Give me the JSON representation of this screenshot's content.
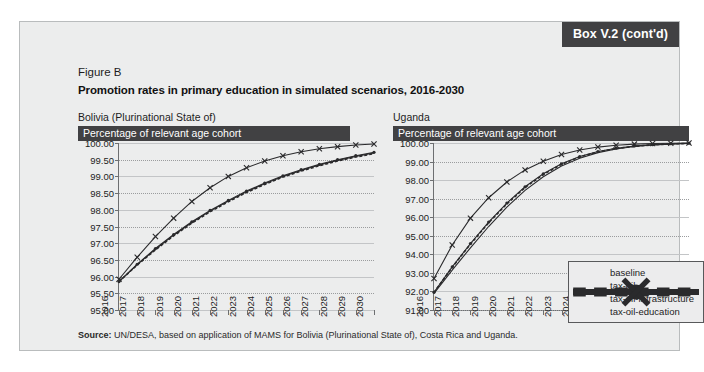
{
  "box_tag": "Box V.2 (cont'd)",
  "figure_label": "Figure B",
  "figure_title": "Promotion rates in primary education in simulated scenarios, 2016-2030",
  "source_prefix": "Source:",
  "source_text": " UN/DESA, based on application of MAMS for Bolivia (Plurinational State of), Costa Rica and Uganda.",
  "colors": {
    "box_background": "#eceded",
    "header_bar": "#414143",
    "series": "#2a2a2c",
    "grid": "#9a9c9e",
    "axis": "#6d6f71"
  },
  "legend": {
    "position": "inside-right-chart-bottom-right",
    "items": [
      {
        "label": "baseline",
        "style": "dashed",
        "marker": "none"
      },
      {
        "label": "tax-oil",
        "style": "solid",
        "marker": "none"
      },
      {
        "label": "tax-oil-infrastructure",
        "style": "solid",
        "marker": "dot"
      },
      {
        "label": "tax-oil-education",
        "style": "solid",
        "marker": "x"
      }
    ]
  },
  "chart_data": [
    {
      "type": "line",
      "panel": "left",
      "title": "Bolivia (Plurinational State of)",
      "ylabel": "Percentage of relevant age cohort",
      "xlabel": "",
      "grid": true,
      "ylim": [
        95.0,
        100.0
      ],
      "yticks": [
        "100.00",
        "99.50",
        "99.00",
        "98.50",
        "98.00",
        "97.50",
        "97.00",
        "96.50",
        "96.00",
        "95.50",
        "95.00"
      ],
      "ytick_values": [
        100.0,
        99.5,
        99.0,
        98.5,
        98.0,
        97.5,
        97.0,
        96.5,
        96.0,
        95.5,
        95.0
      ],
      "categories": [
        "2016",
        "2017",
        "2018",
        "2019",
        "2020",
        "2021",
        "2022",
        "2023",
        "2024",
        "2025",
        "2026",
        "2027",
        "2028",
        "2029",
        "2030"
      ],
      "series": [
        {
          "name": "baseline",
          "values": [
            95.85,
            96.35,
            96.8,
            97.22,
            97.6,
            97.94,
            98.24,
            98.52,
            98.76,
            98.98,
            99.16,
            99.32,
            99.46,
            99.58,
            99.68
          ]
        },
        {
          "name": "tax-oil",
          "values": [
            95.85,
            96.36,
            96.82,
            97.24,
            97.62,
            97.96,
            98.26,
            98.54,
            98.78,
            99.0,
            99.18,
            99.34,
            99.48,
            99.6,
            99.7
          ]
        },
        {
          "name": "tax-oil-infrastructure",
          "values": [
            95.85,
            96.37,
            96.84,
            97.26,
            97.64,
            97.98,
            98.28,
            98.56,
            98.8,
            99.02,
            99.2,
            99.36,
            99.5,
            99.62,
            99.72
          ]
        },
        {
          "name": "tax-oil-education",
          "values": [
            95.92,
            96.58,
            97.2,
            97.75,
            98.25,
            98.66,
            99.0,
            99.26,
            99.46,
            99.62,
            99.74,
            99.83,
            99.89,
            99.94,
            99.97
          ]
        }
      ]
    },
    {
      "type": "line",
      "panel": "right",
      "title": "Uganda",
      "ylabel": "Percentage of relevant age cohort",
      "xlabel": "",
      "grid": true,
      "ylim": [
        91.0,
        100.0
      ],
      "yticks": [
        "100.00",
        "99.00",
        "98.00",
        "97.00",
        "96.00",
        "95.00",
        "94.00",
        "93.00",
        "92.00",
        "91.00"
      ],
      "ytick_values": [
        100.0,
        99.0,
        98.0,
        97.0,
        96.0,
        95.0,
        94.0,
        93.0,
        92.0,
        91.0
      ],
      "categories": [
        "2016",
        "2017",
        "2018",
        "2019",
        "2020",
        "2021",
        "2022",
        "2023",
        "2024",
        "2025",
        "2026",
        "2027",
        "2028",
        "2029",
        "2030"
      ],
      "series": [
        {
          "name": "baseline",
          "values": [
            91.95,
            93.3,
            94.55,
            95.7,
            96.72,
            97.6,
            98.3,
            98.85,
            99.25,
            99.52,
            99.7,
            99.82,
            99.9,
            99.95,
            99.98
          ]
        },
        {
          "name": "tax-oil",
          "values": [
            91.9,
            93.15,
            94.35,
            95.5,
            96.55,
            97.45,
            98.18,
            98.76,
            99.18,
            99.48,
            99.68,
            99.81,
            99.89,
            99.94,
            99.98
          ]
        },
        {
          "name": "tax-oil-infrastructure",
          "values": [
            91.95,
            93.32,
            94.58,
            95.74,
            96.76,
            97.64,
            98.34,
            98.88,
            99.27,
            99.54,
            99.72,
            99.84,
            99.91,
            99.96,
            99.99
          ]
        },
        {
          "name": "tax-oil-education",
          "values": [
            92.7,
            94.5,
            95.95,
            97.05,
            97.9,
            98.55,
            99.02,
            99.38,
            99.62,
            99.78,
            99.88,
            99.94,
            99.97,
            99.99,
            100.0
          ]
        }
      ]
    }
  ]
}
